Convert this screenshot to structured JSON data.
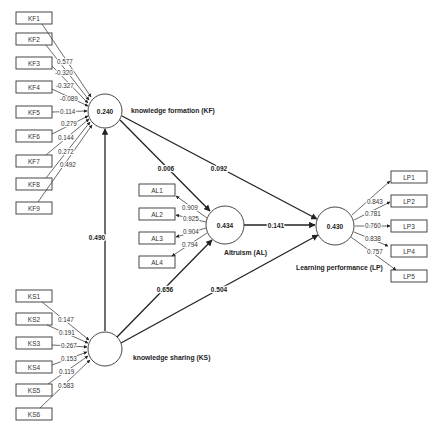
{
  "diagram": {
    "type": "PLS-SEM structural model",
    "constructs": {
      "KF": {
        "label": "knowledge formation (KF)",
        "r2": "0.240"
      },
      "KS": {
        "label": "knowledge sharing (KS)",
        "r2": ""
      },
      "AL": {
        "label": "Altruism (AL)",
        "r2": "0.434"
      },
      "LP": {
        "label": "Learning performance (LP)",
        "r2": "0.430"
      }
    },
    "indicators": {
      "KF": [
        {
          "name": "KF1",
          "loading": "0.577"
        },
        {
          "name": "KF2",
          "loading": "-0.320"
        },
        {
          "name": "KF3",
          "loading": "-0.327"
        },
        {
          "name": "KF4",
          "loading": "-0.089"
        },
        {
          "name": "KF5",
          "loading": "0.114"
        },
        {
          "name": "KF6",
          "loading": "0.279"
        },
        {
          "name": "KF7",
          "loading": "0.144"
        },
        {
          "name": "KF8",
          "loading": "0.272"
        },
        {
          "name": "KF9",
          "loading": "0.492"
        }
      ],
      "AL": [
        {
          "name": "AL1",
          "loading": "0.909"
        },
        {
          "name": "AL2",
          "loading": "0.925"
        },
        {
          "name": "AL3",
          "loading": "0.904"
        },
        {
          "name": "AL4",
          "loading": "0.794"
        }
      ],
      "LP": [
        {
          "name": "LP1",
          "loading": "0.843"
        },
        {
          "name": "LP2",
          "loading": "0.781"
        },
        {
          "name": "LP3",
          "loading": "0.760"
        },
        {
          "name": "LP4",
          "loading": "0.838"
        },
        {
          "name": "LP5",
          "loading": "0.757"
        }
      ],
      "KS": [
        {
          "name": "KS1",
          "loading": "0.147"
        },
        {
          "name": "KS2",
          "loading": "0.191"
        },
        {
          "name": "KS3",
          "loading": "0.267"
        },
        {
          "name": "KS4",
          "loading": "0.153"
        },
        {
          "name": "KS5",
          "loading": "0.119"
        },
        {
          "name": "KS6",
          "loading": "0.583"
        }
      ]
    },
    "paths": {
      "KS_KF": "0.490",
      "KF_AL": "0.006",
      "KF_LP": "0.092",
      "KS_AL": "0.656",
      "KS_LP": "0.504",
      "AL_LP": "0.141"
    }
  }
}
